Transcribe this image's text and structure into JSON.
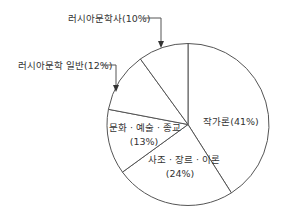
{
  "chart_data": {
    "type": "pie",
    "title": "",
    "start_angle_deg": 0,
    "direction": "clockwise",
    "slices": [
      {
        "label": "작가론",
        "value": 41,
        "display": "작가론(41%)"
      },
      {
        "label": "사조·장르·이론",
        "value": 24,
        "display_line1": "사조 · 장르 · 이론",
        "display_line2": "(24%)"
      },
      {
        "label": "문화·예술·종교",
        "value": 13,
        "display_line1": "문화 · 예술 · 종교",
        "display_line2": "(13%)"
      },
      {
        "label": "러시아문학 일반",
        "value": 12,
        "display": "러시아문학 일반(12%)",
        "callout": true
      },
      {
        "label": "러시아문학사",
        "value": 10,
        "display": "러시아문학사(10%)",
        "callout": true
      }
    ],
    "categories": [
      "작가론",
      "사조·장르·이론",
      "문화·예술·종교",
      "러시아문학 일반",
      "러시아문학사"
    ],
    "values": [
      41,
      24,
      13,
      12,
      10
    ],
    "unit": "%",
    "legend": "none",
    "colors": {
      "fill": "#ffffff",
      "stroke": "#555555",
      "text": "#333333"
    }
  }
}
